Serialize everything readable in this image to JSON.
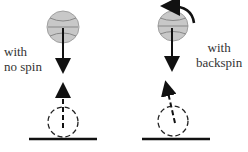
{
  "panels": [
    {
      "id": "no-spin",
      "label_line1": "with",
      "label_line2": "no spin"
    },
    {
      "id": "backspin",
      "label_line1": "with",
      "label_line2": "backspin"
    }
  ],
  "colors": {
    "ball_fill": "#c8c8c8",
    "ball_stroke": "#9a9a9a",
    "ink": "#111111"
  }
}
